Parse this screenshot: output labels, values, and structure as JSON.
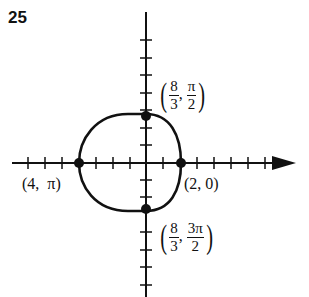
{
  "problem_number": "25",
  "labels": {
    "top": {
      "r_num": "8",
      "r_den": "3",
      "t_num": "π",
      "t_den": "2"
    },
    "bottom": {
      "r_num": "8",
      "r_den": "3",
      "t_num": "3π",
      "t_den": "2"
    },
    "left": "(4,  π)",
    "right": "(2, 0)"
  },
  "diagram": {
    "type": "polar-graph",
    "curve": "ellipse-like closed curve",
    "points": [
      {
        "r": "8/3",
        "theta": "π/2"
      },
      {
        "r": "4",
        "theta": "π"
      },
      {
        "r": "2",
        "theta": "0"
      },
      {
        "r": "8/3",
        "theta": "3π/2"
      }
    ]
  }
}
